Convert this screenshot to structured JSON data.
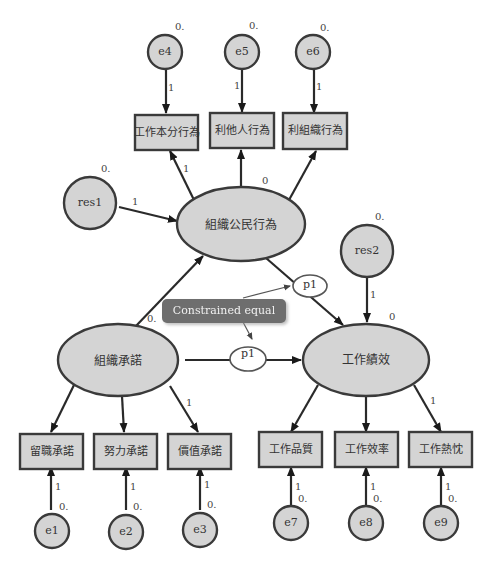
{
  "latent": {
    "ocb": "組織公民行為",
    "commitment": "組織承諾",
    "performance": "工作績效"
  },
  "observed": {
    "ocb_items": [
      "工作本分行為",
      "利他人行為",
      "利組織行為"
    ],
    "commitment_items": [
      "留職承諾",
      "努力承諾",
      "價值承諾"
    ],
    "performance_items": [
      "工作品質",
      "工作效率",
      "工作熱忱"
    ]
  },
  "errors": {
    "ocb": [
      "e4",
      "e5",
      "e6"
    ],
    "commitment": [
      "e1",
      "e2",
      "e3"
    ],
    "performance": [
      "e7",
      "e8",
      "e9"
    ],
    "res1": "res1",
    "res2": "res2"
  },
  "values": {
    "zero_dot": "0.",
    "zero": "0",
    "one": "1"
  },
  "constraint": {
    "label": "Constrained equal",
    "param": "p1"
  }
}
